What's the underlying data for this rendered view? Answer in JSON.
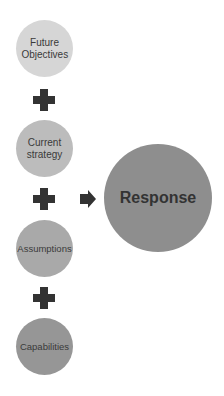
{
  "diagram": {
    "inputs": [
      {
        "label": "Future Objectives",
        "color": "#d6d6d6"
      },
      {
        "label": "Current strategy",
        "color": "#bcbcbc"
      },
      {
        "label": "Assumptions",
        "color": "#a9a9a9"
      },
      {
        "label": "Capabilities",
        "color": "#969696"
      }
    ],
    "operator": "plus-icon",
    "connector": "arrow-right-icon",
    "output": {
      "label": "Response",
      "color": "#8e8e8e"
    }
  }
}
